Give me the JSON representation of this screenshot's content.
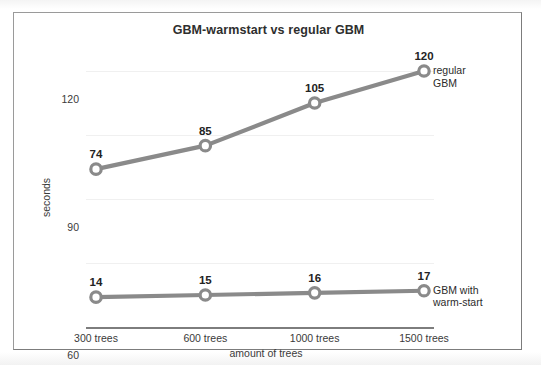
{
  "chart_data": {
    "type": "line",
    "title": "GBM-warmstart vs regular GBM",
    "xlabel": "amount of trees",
    "ylabel": "seconds",
    "categories": [
      "300 trees",
      "600 trees",
      "1000 trees",
      "1500 trees"
    ],
    "ylim": [
      0,
      130
    ],
    "yticks": [
      0,
      30,
      60,
      90,
      120
    ],
    "ytick_labels": [
      "0",
      "30",
      "60",
      "90",
      "120"
    ],
    "grid": true,
    "legend_position": "right-inline-at-series-end",
    "series": [
      {
        "name": "regular GBM",
        "name_line1": "regular",
        "name_line2": "GBM",
        "values": [
          74,
          85,
          105,
          120
        ],
        "point_labels": [
          "74",
          "85",
          "105",
          "120"
        ],
        "color": "#8a8a8a",
        "marker": "open-circle"
      },
      {
        "name": "GBM with warm-start",
        "name_line1": "GBM with",
        "name_line2": "warm-start",
        "values": [
          14,
          15,
          16,
          17
        ],
        "point_labels": [
          "14",
          "15",
          "16",
          "17"
        ],
        "color": "#8a8a8a",
        "marker": "open-circle"
      }
    ],
    "annotations": []
  },
  "colors": {
    "line": "#8a8a8a",
    "marker_fill": "#ffffff",
    "axis": "#7d7d7d",
    "grid": "#f0f0f0",
    "text": "#2e2e2e",
    "frame_border": "#9a9a9a",
    "background": "#ffffff"
  }
}
